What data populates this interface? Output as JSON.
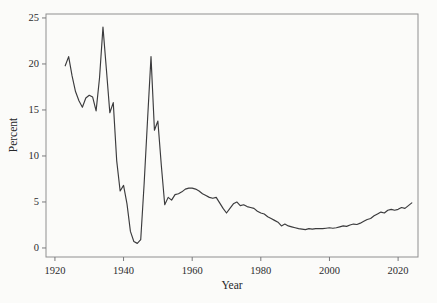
{
  "colors": {
    "line": "#3b3b3d",
    "frame": "#8f8f90",
    "tick": "#7a7a7c",
    "text": "#2b2b2e",
    "background": "#fbfbf9"
  },
  "chart_data": {
    "type": "line",
    "title": "",
    "xlabel": "Year",
    "ylabel": "Percent",
    "x_tick_labels": [
      "1920",
      "1940",
      "1960",
      "1980",
      "2000",
      "2020"
    ],
    "x_ticks": [
      1920,
      1940,
      1960,
      1980,
      2000,
      2020
    ],
    "y_tick_labels": [
      "0",
      "5",
      "10",
      "15",
      "20",
      "25"
    ],
    "y_ticks": [
      0,
      5,
      10,
      15,
      20,
      25
    ],
    "xlim": [
      1917.4,
      2025.8
    ],
    "ylim": [
      -0.98,
      25.43
    ],
    "grid": false,
    "legend": "none",
    "series": [
      {
        "name": "percent",
        "x": [
          1923,
          1924,
          1925,
          1926,
          1927,
          1928,
          1929,
          1930,
          1931,
          1932,
          1933,
          1934,
          1935,
          1936,
          1937,
          1938,
          1939,
          1940,
          1941,
          1942,
          1943,
          1944,
          1945,
          1946,
          1947,
          1948,
          1949,
          1950,
          1951,
          1952,
          1953,
          1954,
          1955,
          1956,
          1957,
          1958,
          1959,
          1960,
          1961,
          1962,
          1963,
          1964,
          1965,
          1966,
          1967,
          1968,
          1969,
          1970,
          1971,
          1972,
          1973,
          1974,
          1975,
          1976,
          1977,
          1978,
          1979,
          1980,
          1981,
          1982,
          1983,
          1984,
          1985,
          1986,
          1987,
          1988,
          1989,
          1990,
          1991,
          1992,
          1993,
          1994,
          1995,
          1996,
          1997,
          1998,
          1999,
          2000,
          2001,
          2002,
          2003,
          2004,
          2005,
          2006,
          2007,
          2008,
          2009,
          2010,
          2011,
          2012,
          2013,
          2014,
          2015,
          2016,
          2017,
          2018,
          2019,
          2020,
          2021,
          2022,
          2023,
          2024
        ],
        "y": [
          19.8,
          20.8,
          18.7,
          17.0,
          16.0,
          15.3,
          16.3,
          16.6,
          16.4,
          14.9,
          18.5,
          24.0,
          19.4,
          14.7,
          15.8,
          9.5,
          6.2,
          6.8,
          4.8,
          1.8,
          0.7,
          0.5,
          0.9,
          7.0,
          14.0,
          20.8,
          12.8,
          13.8,
          9.0,
          4.7,
          5.5,
          5.2,
          5.8,
          5.9,
          6.1,
          6.4,
          6.5,
          6.5,
          6.4,
          6.2,
          5.9,
          5.7,
          5.5,
          5.4,
          5.5,
          4.9,
          4.3,
          3.8,
          4.3,
          4.8,
          5.0,
          4.6,
          4.7,
          4.5,
          4.4,
          4.3,
          4.0,
          3.8,
          3.7,
          3.4,
          3.2,
          3.0,
          2.8,
          2.4,
          2.6,
          2.4,
          2.3,
          2.2,
          2.1,
          2.05,
          2.0,
          2.1,
          2.05,
          2.1,
          2.1,
          2.1,
          2.15,
          2.2,
          2.15,
          2.2,
          2.3,
          2.4,
          2.35,
          2.5,
          2.6,
          2.55,
          2.7,
          2.9,
          3.1,
          3.2,
          3.5,
          3.7,
          3.9,
          3.8,
          4.1,
          4.2,
          4.1,
          4.2,
          4.4,
          4.3,
          4.6,
          4.9
        ]
      }
    ]
  }
}
